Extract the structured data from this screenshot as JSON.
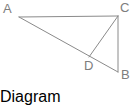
{
  "figure": {
    "kind": "geometry-diagram",
    "background_color": "#ffffff",
    "stroke_color": "#8a8a8a",
    "label_color": "#7d7d7d",
    "stroke_width": 1,
    "canvas": {
      "width": 137,
      "height": 88
    },
    "points": {
      "A": {
        "label": "A",
        "x": 19,
        "y": 17
      },
      "B": {
        "label": "B",
        "x": 118,
        "y": 72
      },
      "C": {
        "label": "C",
        "x": 118,
        "y": 16
      },
      "D": {
        "label": "D",
        "x": 89,
        "y": 57
      }
    },
    "segments": [
      {
        "name": "AC",
        "from": "A",
        "to": "C"
      },
      {
        "name": "AB",
        "from": "A",
        "to": "B"
      },
      {
        "name": "CB",
        "from": "C",
        "to": "B"
      },
      {
        "name": "CD",
        "from": "C",
        "to": "D"
      }
    ],
    "labels": {
      "A": "A",
      "B": "B",
      "C": "C",
      "D": "D"
    }
  }
}
